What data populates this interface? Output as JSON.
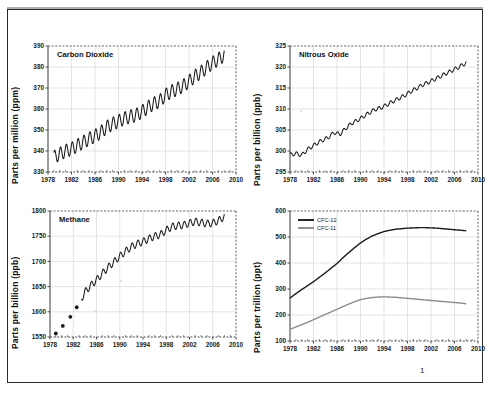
{
  "document": {
    "page_number": "1",
    "background": "#ffffff",
    "frame_color": "#2a2a2a"
  },
  "colors": {
    "series_dark": "#1b1b1b",
    "series_gray": "#8d8d8d",
    "grid": "#c9c9c9",
    "axis": "#3a3a3a"
  },
  "chart_data": [
    {
      "id": "carbon-dioxide",
      "type": "line",
      "title": "Carbon Dioxide",
      "ylabel": "Parts per million (ppm)",
      "xlabel": "",
      "ylim": [
        330,
        390
      ],
      "xlim": [
        1978,
        2010
      ],
      "yticks": [
        330,
        340,
        350,
        360,
        370,
        380,
        390
      ],
      "xticks": [
        1978,
        1982,
        1986,
        1990,
        1994,
        1998,
        2002,
        2006,
        2010
      ],
      "grid": true,
      "seasonal_amplitude": 3.2,
      "x": [
        1979.0,
        1980.0,
        1981.0,
        1982.0,
        1983.0,
        1984.0,
        1985.0,
        1986.0,
        1987.0,
        1988.0,
        1989.0,
        1990.0,
        1991.0,
        1992.0,
        1993.0,
        1994.0,
        1995.0,
        1996.0,
        1997.0,
        1998.0,
        1999.0,
        2000.0,
        2001.0,
        2002.0,
        2003.0,
        2004.0,
        2005.0,
        2006.0,
        2007.0,
        2008.0
      ],
      "values": [
        337.0,
        338.6,
        340.0,
        341.0,
        342.6,
        344.2,
        345.8,
        347.2,
        348.9,
        351.4,
        352.9,
        354.2,
        355.5,
        356.4,
        357.1,
        358.8,
        360.8,
        362.6,
        363.7,
        366.6,
        368.3,
        369.5,
        371.0,
        373.1,
        375.6,
        377.4,
        379.7,
        381.9,
        383.7,
        385.6
      ],
      "notes": "Monthly mean with strong seasonal sawtooth oscillation"
    },
    {
      "id": "nitrous-oxide",
      "type": "line",
      "title": "Nitrous Oxide",
      "ylabel": "Parts per billion (ppb)",
      "xlabel": "",
      "ylim": [
        295,
        325
      ],
      "xlim": [
        1978,
        2010
      ],
      "yticks": [
        295,
        300,
        305,
        310,
        315,
        320,
        325
      ],
      "xticks": [
        1978,
        1982,
        1986,
        1990,
        1994,
        1998,
        2002,
        2006,
        2010
      ],
      "grid": true,
      "seasonal_amplitude": 0.45,
      "x": [
        1978.0,
        1979.0,
        1980.0,
        1981.0,
        1982.0,
        1983.0,
        1984.5,
        1985.5,
        1986.5,
        1987.5,
        1988.5,
        1989.5,
        1990.5,
        1991.5,
        1992.5,
        1993.5,
        1994.5,
        1995.5,
        1996.5,
        1997.5,
        1998.5,
        1999.5,
        2000.5,
        2001.5,
        2002.5,
        2003.5,
        2004.5,
        2005.5,
        2006.5,
        2007.5,
        2008.0
      ],
      "values": [
        299.1,
        299.4,
        299.0,
        300.4,
        301.3,
        302.2,
        303.2,
        304.4,
        304.0,
        305.4,
        306.6,
        307.3,
        308.2,
        309.1,
        309.9,
        310.3,
        311.0,
        311.8,
        312.5,
        313.2,
        314.1,
        314.9,
        315.7,
        316.3,
        317.0,
        317.7,
        318.4,
        319.1,
        319.8,
        320.6,
        321.0
      ],
      "notes": "Noisy early record 1978-1983 with data gap, then smooth rise"
    },
    {
      "id": "methane",
      "type": "line",
      "title": "Methane",
      "ylabel": "Parts per billion (ppb)",
      "xlabel": "",
      "ylim": [
        1550,
        1800
      ],
      "xlim": [
        1978,
        2010
      ],
      "yticks": [
        1550,
        1600,
        1650,
        1700,
        1750,
        1800
      ],
      "xticks": [
        1978,
        1982,
        1986,
        1990,
        1994,
        1998,
        2002,
        2006,
        2010
      ],
      "grid": true,
      "seasonal_amplitude": 7.0,
      "marker_points_x": [
        1979.0,
        1980.2,
        1981.5,
        1982.6
      ],
      "marker_points_y": [
        1557,
        1572,
        1590,
        1609
      ],
      "x": [
        1983.4,
        1984.0,
        1985.0,
        1986.0,
        1987.0,
        1988.0,
        1989.0,
        1990.0,
        1991.0,
        1992.0,
        1993.0,
        1994.0,
        1995.0,
        1996.0,
        1997.0,
        1998.0,
        1999.0,
        2000.0,
        2001.0,
        2002.0,
        2003.0,
        2004.0,
        2005.0,
        2006.0,
        2007.0,
        2008.0
      ],
      "values": [
        1626,
        1639,
        1652,
        1663,
        1676,
        1688,
        1699,
        1710,
        1720,
        1729,
        1735,
        1739,
        1745,
        1750,
        1753,
        1762,
        1769,
        1771,
        1772,
        1776,
        1779,
        1777,
        1775,
        1776,
        1781,
        1789
      ],
      "notes": "Discrete dots before 1983, then continuous series; plateau after 1999"
    },
    {
      "id": "cfcs",
      "type": "line",
      "title": "",
      "ylabel": "Parts per trillion (ppt)",
      "xlabel": "",
      "ylim": [
        100,
        600
      ],
      "xlim": [
        1978,
        2010
      ],
      "yticks": [
        100,
        200,
        300,
        400,
        500,
        600
      ],
      "xticks": [
        1978,
        1982,
        1986,
        1990,
        1994,
        1998,
        2002,
        2006,
        2010
      ],
      "grid": true,
      "legend_position": "top-left",
      "x": [
        1978,
        1979,
        1980,
        1981,
        1982,
        1983,
        1984,
        1985,
        1986,
        1987,
        1988,
        1989,
        1990,
        1991,
        1992,
        1993,
        1994,
        1995,
        1996,
        1997,
        1998,
        1999,
        2000,
        2001,
        2002,
        2003,
        2004,
        2005,
        2006,
        2007,
        2008
      ],
      "series": [
        {
          "name": "CFC-12",
          "color": "#1b1b1b",
          "values": [
            265,
            282,
            298,
            313,
            328,
            345,
            362,
            380,
            398,
            420,
            440,
            459,
            477,
            492,
            504,
            513,
            521,
            526,
            530,
            532,
            534,
            535,
            536,
            536,
            535,
            534,
            532,
            530,
            528,
            526,
            524
          ]
        },
        {
          "name": "CFC-11",
          "color": "#8d8d8d",
          "values": [
            145,
            154,
            163,
            172,
            182,
            192,
            202,
            212,
            222,
            232,
            242,
            251,
            259,
            264,
            267,
            269,
            270,
            269,
            268,
            266,
            264,
            262,
            260,
            258,
            256,
            254,
            252,
            250,
            248,
            246,
            243
          ]
        }
      ],
      "notes": "CFC-12 peaks ~536 around 2000-2001; CFC-11 peaks ~270 around 1994"
    }
  ]
}
